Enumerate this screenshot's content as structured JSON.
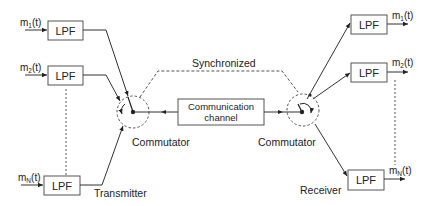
{
  "diagram": {
    "type": "TDM system block diagram",
    "transmitter": {
      "label": "Transmitter",
      "inputs": [
        {
          "signal": "m",
          "sub": "1",
          "suffix": "(t)",
          "block": "LPF"
        },
        {
          "signal": "m",
          "sub": "2",
          "suffix": "(t)",
          "block": "LPF"
        },
        {
          "signal": "m",
          "sub": "N",
          "suffix": "(t)",
          "block": "LPF"
        }
      ],
      "commutator_label": "Commutator"
    },
    "channel": {
      "line1": "Communication",
      "line2": "channel"
    },
    "sync_label": "Synchronized",
    "receiver": {
      "label": "Receiver",
      "commutator_label": "Commutator",
      "outputs": [
        {
          "signal": "m",
          "sub": "1",
          "suffix": "(t)",
          "block": "LPF"
        },
        {
          "signal": "m",
          "sub": "2",
          "suffix": "(t)",
          "block": "LPF"
        },
        {
          "signal": "m",
          "sub": "N",
          "suffix": "(t)",
          "block": "LPF"
        }
      ]
    },
    "colors": {
      "line": "#333333",
      "box_border": "#555555",
      "dashed": "#555555"
    }
  }
}
